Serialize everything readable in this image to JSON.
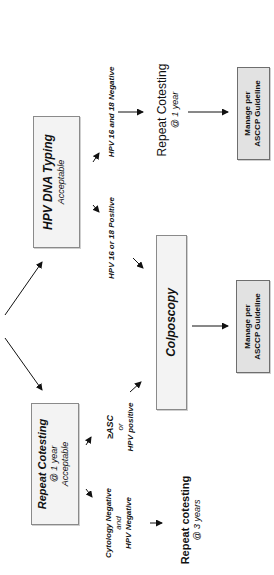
{
  "diagram": {
    "orientation": "rotated 90 degrees counter-clockwise",
    "nodes": {
      "hpv_typing": {
        "title": "HPV DNA Typing",
        "subtitle": "Acceptable"
      },
      "repeat_cotesting_1yr": {
        "title": "Repeat Cotesting",
        "line2": "@ 1 year",
        "line3": "Acceptable"
      },
      "colposcopy": {
        "title": "Colposcopy"
      },
      "manage_top": {
        "line1": "Manage per",
        "line2": "ASCCP Guideline"
      },
      "manage_bottom": {
        "line1": "Manage per",
        "line2": "ASCCP Guideline"
      },
      "repeat_after_negative_typing": {
        "title": "Repeat Cotesting",
        "sub": "@ 1 year"
      },
      "repeat_3yr": {
        "title": "Repeat cotesting",
        "sub": "@ 3 years"
      }
    },
    "labels": {
      "hpv_neg": "HPV 16 and 18 Negative",
      "hpv_pos": "HPV 16 or 18 Positive",
      "asc_line1": "≥ASC",
      "asc_line2": "or",
      "asc_line3": "HPV positive",
      "cyto_line1": "Cytology Negative",
      "cyto_line2": "and",
      "cyto_line3": "HPV Negative"
    },
    "colors": {
      "box_fill": "#f3f3f3",
      "manage_fill": "#e2e2e2",
      "border": "#8a8a8a",
      "line": "#111111"
    }
  }
}
